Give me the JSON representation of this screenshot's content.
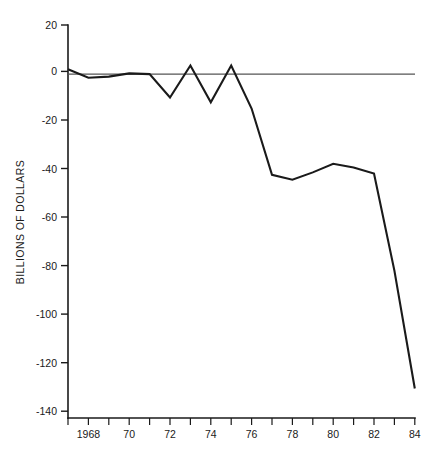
{
  "chart_data": {
    "type": "line",
    "title": "",
    "subtitle": "",
    "xlabel": "",
    "ylabel": "BILLIONS OF DOLLARS",
    "xlim": [
      1967,
      1984
    ],
    "ylim": [
      -140,
      20
    ],
    "grid": false,
    "legend": "none",
    "zero_reference_line": true,
    "y_ticks": [
      20,
      0,
      -20,
      -40,
      -60,
      -80,
      -100,
      -120,
      -140
    ],
    "y_tick_labels": [
      "20",
      "0",
      "-20",
      "-40",
      "-60",
      "-80",
      "-100",
      "-120",
      "-140"
    ],
    "x_ticks": [
      1967,
      1968,
      1969,
      1970,
      1971,
      1972,
      1973,
      1974,
      1975,
      1976,
      1977,
      1978,
      1979,
      1980,
      1981,
      1982,
      1983,
      1984
    ],
    "x_tick_labels": [
      "",
      "1968",
      "",
      "70",
      "",
      "72",
      "",
      "74",
      "",
      "76",
      "",
      "78",
      "",
      "80",
      "",
      "82",
      "",
      "84"
    ],
    "series": [
      {
        "name": "Federal budget surplus or deficit",
        "x": [
          1967,
          1968,
          1969,
          1970,
          1971,
          1972,
          1973,
          1974,
          1975,
          1976,
          1977,
          1978,
          1979,
          1980,
          1981,
          1982,
          1983,
          1984
        ],
        "values": [
          2,
          -1.5,
          -1,
          0.3,
          0,
          -9.5,
          3.5,
          -11.5,
          3.5,
          -14,
          -41,
          -43,
          -40,
          -36.5,
          -38,
          -40.5,
          -80,
          -128
        ]
      }
    ]
  },
  "axis": {
    "y_title": "BILLIONS OF DOLLARS"
  }
}
